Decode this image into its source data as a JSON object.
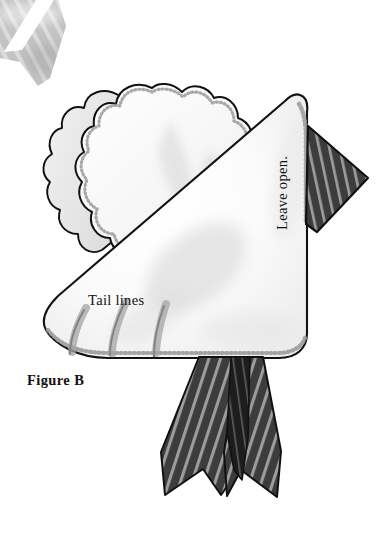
{
  "figure": {
    "title": "Figure B",
    "kind": "sewing-pattern-illustration",
    "background_color": "#ffffff",
    "width": 382,
    "height": 560
  },
  "labels": {
    "tail_lines": "Tail lines",
    "figure_caption": "Figure B",
    "leave_open": "Leave open."
  },
  "colors": {
    "outline": "#111111",
    "body_fill": "#ffffff",
    "body_shadow": "#e2e2e2",
    "wing_shadow": "#dcdcdc",
    "stitch": "#9a9a9a",
    "tie_dark": "#3c3c3c",
    "tie_darkest": "#1d1d1d",
    "tie_stripe": "#9c9c9c",
    "tie_light": "#b4b4b4",
    "tie_light_stripe": "#d8d8d8",
    "text": "#111111"
  },
  "parts": [
    {
      "name": "necktie-tip-top-left",
      "description": "cropped light gray striped necktie tip entering from top-left corner",
      "fill": "#b4b4b4"
    },
    {
      "name": "scalloped-wing-back",
      "description": "rear scalloped wing layer of the dove",
      "fill": "#ececec"
    },
    {
      "name": "scalloped-wing-front",
      "description": "front scalloped wing layer of the dove",
      "fill": "#ffffff"
    },
    {
      "name": "dove-body",
      "description": "large white triangular body piece of the dove",
      "fill": "#ffffff"
    },
    {
      "name": "tail-line-1",
      "description": "first curved tail stitch line at lower left"
    },
    {
      "name": "tail-line-2",
      "description": "second curved tail stitch line at lower left"
    },
    {
      "name": "tail-line-3",
      "description": "third curved tail stitch line at lower left"
    },
    {
      "name": "striped-beak-flap",
      "description": "dark striped triangular necktie flap on the right side",
      "fill": "#3c3c3c"
    },
    {
      "name": "striped-tie-left-tail",
      "description": "left hanging striped necktie tail below the body",
      "fill": "#3c3c3c"
    },
    {
      "name": "striped-tie-center-fold",
      "description": "narrow dark center fold of the hanging necktie",
      "fill": "#1d1d1d"
    },
    {
      "name": "striped-tie-right-tail",
      "description": "right hanging striped necktie tail below the body",
      "fill": "#3c3c3c"
    }
  ]
}
